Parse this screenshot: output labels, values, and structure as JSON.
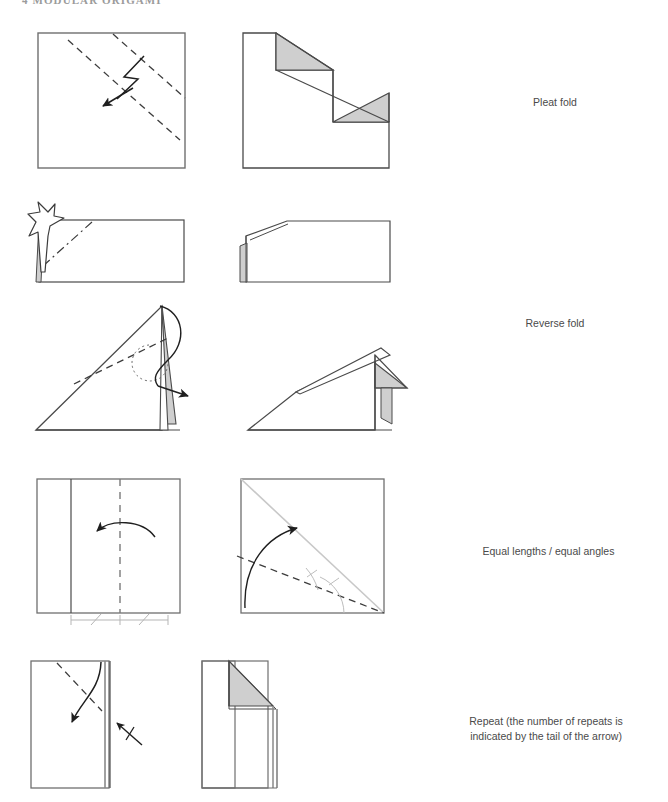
{
  "page": {
    "width": 668,
    "height": 802,
    "background": "#ffffff",
    "running_header": "4  MODULAR ORIGAMI"
  },
  "colors": {
    "line": "#3c3c3c",
    "line_light": "#8a8a8a",
    "shade": "#cfcfcf",
    "shade_light": "#d9d9d9",
    "guide": "#c8c8c8",
    "text": "#4a4a4a",
    "header_text": "#9b9b9b"
  },
  "rows": [
    {
      "id": "pleat-fold",
      "caption": "Pleat fold",
      "before": {
        "name": "pleat-fold-before-diagram",
        "shape": "square",
        "markings": [
          "valley-dashed-diagonal",
          "mountain-dashdot-diagonal",
          "zigzag-pleat-arrow"
        ]
      },
      "after": {
        "name": "pleat-fold-after-diagram",
        "shape": "stepped-polygon",
        "markings": [
          "two-shaded-triangles"
        ]
      }
    },
    {
      "id": "reverse-fold-1",
      "caption": "Reverse fold",
      "before": {
        "name": "reverse-fold-before-diagram",
        "shape": "rectangle",
        "markings": [
          "mountain-dashdot-diagonal",
          "hollow-push-arrow"
        ]
      },
      "after": {
        "name": "reverse-fold-after-diagram",
        "shape": "rectangle-beveled-corner",
        "markings": [
          "small-shaded-flap"
        ]
      }
    },
    {
      "id": "reverse-fold-2",
      "caption": "",
      "before": {
        "name": "reverse-fold-triangle-before-diagram",
        "shape": "right-triangle",
        "markings": [
          "valley-dashed-line",
          "dotted-arc",
          "wrap-around-arrow",
          "shaded-narrow-flap"
        ]
      },
      "after": {
        "name": "reverse-fold-triangle-after-diagram",
        "shape": "flattened-triangle",
        "markings": [
          "shaded-triangle-flap",
          "shaded-tab"
        ]
      }
    },
    {
      "id": "equal-lengths-angles",
      "caption": "Equal lengths / equal angles",
      "before": {
        "name": "equal-lengths-before-diagram",
        "shape": "square",
        "markings": [
          "solid-vertical-crease",
          "dashed-vertical-center-line",
          "curved-fold-arrow",
          "equal-length-measure-bars"
        ]
      },
      "after": {
        "name": "equal-angles-after-diagram",
        "shape": "square",
        "markings": [
          "gray-diagonal-guide",
          "dashed-bisector-line",
          "curved-fold-arrow",
          "equal-angle-arcs"
        ]
      }
    },
    {
      "id": "repeat",
      "caption": "Repeat (the number of repeats is\nindicated by the tail of the arrow)",
      "before": {
        "name": "repeat-before-diagram",
        "shape": "tall-rectangle",
        "markings": [
          "valley-dashed-diagonal",
          "curved-fold-arrow",
          "repeat-arrow-one-tick"
        ]
      },
      "after": {
        "name": "repeat-after-diagram",
        "shape": "tall-rectangle-folded-corner",
        "markings": [
          "shaded-folded-triangle"
        ]
      }
    }
  ]
}
